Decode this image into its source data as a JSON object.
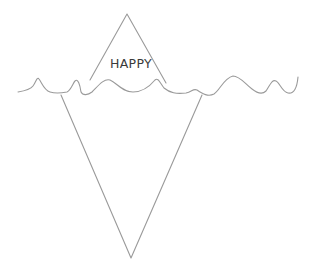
{
  "diagram": {
    "type": "iceberg",
    "tip_label": "HAPPY",
    "colors": {
      "line": "#9a9a9a",
      "text": "#3a3a3a",
      "background": "#ffffff"
    },
    "shapes": {
      "tip_triangle": {
        "apex": [
          127,
          14
        ],
        "base_left": [
          88,
          80
        ],
        "base_right": [
          166,
          82
        ]
      },
      "submerged_triangle": {
        "top_left": [
          60,
          96
        ],
        "top_right": [
          202,
          96
        ],
        "bottom": [
          131,
          258
        ]
      },
      "waterline": "wavy line spanning x 18 to 298 at y approx 80-98"
    }
  }
}
